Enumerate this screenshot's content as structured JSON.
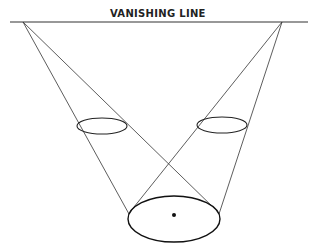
{
  "diagram": {
    "title": "VANISHING LINE",
    "colors": {
      "line": "#333333",
      "background": "#ffffff"
    },
    "horizon": {
      "x1": 10,
      "y1": 22,
      "x2": 308,
      "y2": 22
    },
    "vanishing_points": [
      {
        "id": "left",
        "x": 23,
        "y": 22
      },
      {
        "id": "right",
        "x": 282,
        "y": 22
      }
    ],
    "ellipses": [
      {
        "id": "small-left",
        "cx": 102,
        "cy": 126,
        "rx": 25,
        "ry": 8
      },
      {
        "id": "small-right",
        "cx": 222,
        "cy": 125,
        "rx": 25,
        "ry": 8
      },
      {
        "id": "large-bottom",
        "cx": 174,
        "cy": 219,
        "rx": 46,
        "ry": 23
      }
    ],
    "center_dot": {
      "cx": 174,
      "cy": 215,
      "r": 2
    }
  }
}
